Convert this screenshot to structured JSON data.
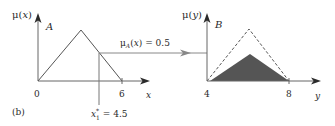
{
  "panel_label": "(b)",
  "left_chart": {
    "y_axis_label": "μ(x)",
    "set_label": "A",
    "x_axis_label": "x",
    "ticks": [
      "0",
      "6"
    ],
    "input_value_label": "x*1 = 4.5",
    "input_value": 4.5,
    "membership_label": "μA(x) = 0.5",
    "membership_value": 0.5,
    "triangle": {
      "start": 0,
      "peak": 3,
      "end": 6
    }
  },
  "right_chart": {
    "y_axis_label": "μ(y)",
    "set_label": "B",
    "x_axis_label": "y",
    "ticks": [
      "4",
      "8"
    ],
    "triangle": {
      "start": 4,
      "peak": 6,
      "end": 8
    },
    "clipped_height": 0.5
  },
  "colors": {
    "axis": "#2a2a2a",
    "line": "#555555",
    "fill": "#555555"
  }
}
